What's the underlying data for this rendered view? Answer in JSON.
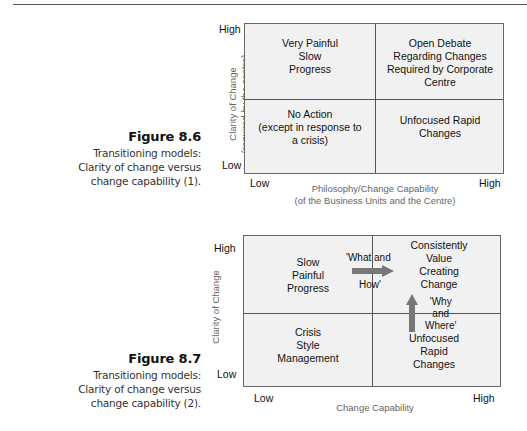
{
  "figures": [
    {
      "number": "Figure 8.6",
      "caption_lines": [
        "Transitioning models:",
        "Clarity of change versus",
        "change capability (1)."
      ],
      "y_axis_label_lines": [
        "Clarity of Change",
        "(required by the centre)"
      ],
      "x_axis_label_lines": [
        "Philosophy/Change Capability",
        "(of the Business Units and the Centre)"
      ],
      "y_ticks": {
        "high": "High",
        "low": "Low"
      },
      "x_ticks": {
        "low": "Low",
        "high": "High"
      },
      "quadrants": {
        "top_left": [
          "Very Painful",
          "Slow",
          "Progress"
        ],
        "top_right": [
          "Open Debate",
          "Regarding Changes",
          "Required by Corporate",
          "Centre"
        ],
        "bottom_left": [
          "No Action",
          "(except in response to",
          "a crisis)"
        ],
        "bottom_right": [
          "Unfocused Rapid",
          "Changes"
        ]
      }
    },
    {
      "number": "Figure 8.7",
      "caption_lines": [
        "Transitioning models:",
        "Clarity of change versus",
        "change capability (2)."
      ],
      "y_axis_label_lines": [
        "Clarity of Change"
      ],
      "x_axis_label_lines": [
        "Change Capability"
      ],
      "y_ticks": {
        "high": "High",
        "low": "Low"
      },
      "x_ticks": {
        "low": "Low",
        "high": "High"
      },
      "quadrants": {
        "top_left": [
          "Slow",
          "Painful",
          "Progress"
        ],
        "top_right": [
          "Consistently",
          "Value",
          "Creating",
          "Change"
        ],
        "bottom_left": [
          "Crisis",
          "Style",
          "Management"
        ],
        "bottom_right": [
          "Unfocused",
          "Rapid",
          "Changes"
        ]
      },
      "arrows": {
        "horizontal": {
          "label_top": "'What and",
          "label_bottom": "How'",
          "color": "#777777"
        },
        "vertical": {
          "label_lines": [
            "'Why",
            "and",
            "Where'"
          ],
          "color": "#777777"
        }
      }
    }
  ]
}
